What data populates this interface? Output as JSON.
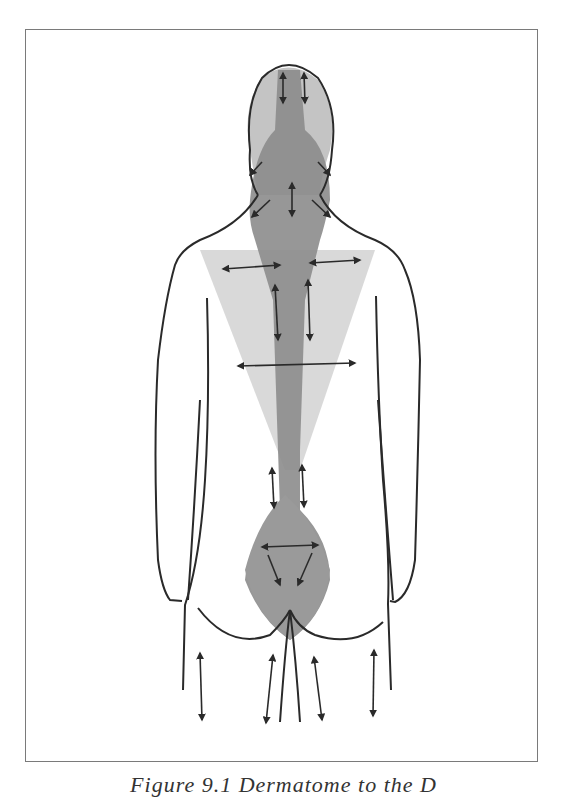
{
  "figure": {
    "caption": "Figure 9.1 Dermatome to the D",
    "colors": {
      "frame": "#7a7a7a",
      "outline": "#2a2a2a",
      "dark_shading": "#8a8a8a",
      "light_shading": "#cfcfcf"
    },
    "arrows": {
      "head": 2,
      "neck": 3,
      "shoulders": 2,
      "upper_back_vertical": 2,
      "mid_back_horizontal": 1,
      "lower_back_vertical": 2,
      "sacrum": 3,
      "legs": 4
    }
  }
}
